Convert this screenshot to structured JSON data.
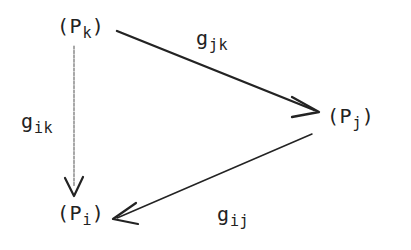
{
  "diagram": {
    "background_color": "#ffffff",
    "ink_color": "#222222",
    "nodes": [
      {
        "id": "node-pk",
        "text": "(P_k)",
        "base": "(P",
        "subscript": "k",
        "close": ")",
        "position": {
          "x": 57,
          "y": 16
        }
      },
      {
        "id": "node-pj",
        "text": "(P_j)",
        "base": "(P",
        "subscript": "j",
        "close": ")",
        "position": {
          "x": 327,
          "y": 106
        }
      },
      {
        "id": "node-pi",
        "text": "(P_i)",
        "base": "(P",
        "subscript": "i",
        "close": ")",
        "position": {
          "x": 57,
          "y": 203
        }
      }
    ],
    "edges": [
      {
        "id": "edge-gjk",
        "text": "g_jk",
        "base": "g",
        "subscript": "jk",
        "from": "node-pk",
        "to": "node-pj",
        "style": "thick-solid",
        "label_position": {
          "x": 196,
          "y": 28
        }
      },
      {
        "id": "edge-gik",
        "text": "g_ik",
        "base": "g",
        "subscript": "ik",
        "from": "node-pk",
        "to": "node-pi",
        "style": "thin-faint-vertical",
        "label_position": {
          "x": 21,
          "y": 111
        }
      },
      {
        "id": "edge-gij",
        "text": "g_ij",
        "base": "g",
        "subscript": "ij",
        "from": "node-pj",
        "to": "node-pi",
        "style": "thin-solid",
        "label_position": {
          "x": 217,
          "y": 204
        }
      }
    ]
  }
}
